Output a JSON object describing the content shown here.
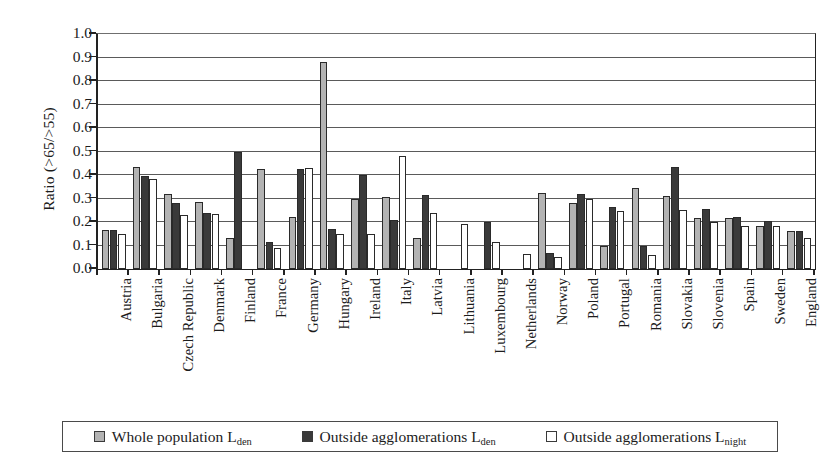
{
  "chart_data": {
    "type": "bar",
    "title": "",
    "xlabel": "",
    "ylabel": "Ratio (>65/>55)",
    "ylim": [
      0.0,
      1.0
    ],
    "ytick_labels": [
      "0.0",
      "0.1",
      "0.2",
      "0.3",
      "0.4",
      "0.5",
      "0.6",
      "0.7",
      "0.8",
      "0.9",
      "1.0"
    ],
    "ytick_values": [
      0.0,
      0.1,
      0.2,
      0.3,
      0.4,
      0.5,
      0.6,
      0.7,
      0.8,
      0.9,
      1.0
    ],
    "grid": true,
    "legend_position": "bottom",
    "categories": [
      "Austria",
      "Bulgaria",
      "Czech Republic",
      "Denmark",
      "Finland",
      "France",
      "Germany",
      "Hungary",
      "Ireland",
      "Italy",
      "Latvia",
      "Lithuania",
      "Luxembourg",
      "Netherlands",
      "Norway",
      "Poland",
      "Portugal",
      "Romania",
      "Slovakia",
      "Slovenia",
      "Spain",
      "Sweden",
      "England"
    ],
    "series": [
      {
        "name": "Whole population Lden",
        "name_base": "Whole population L",
        "name_sub": "den",
        "color": "#b3b3b3",
        "values": [
          0.165,
          0.435,
          0.32,
          0.285,
          0.13,
          0.425,
          0.22,
          0.88,
          0.3,
          0.305,
          0.13,
          null,
          null,
          null,
          0.325,
          0.28,
          0.1,
          0.345,
          0.31,
          0.215,
          0.215,
          0.185,
          0.16
        ]
      },
      {
        "name": "Outside agglomerations Lden",
        "name_base": "Outside agglomerations L",
        "name_sub": "den",
        "color": "#3a3a3a",
        "values": [
          0.165,
          0.395,
          0.28,
          0.24,
          0.5,
          0.115,
          0.425,
          0.17,
          0.4,
          0.21,
          0.315,
          null,
          0.2,
          null,
          0.07,
          0.32,
          0.265,
          0.1,
          0.435,
          0.255,
          0.22,
          0.205,
          0.16
        ]
      },
      {
        "name": "Outside agglomerations Lnight",
        "name_base": "Outside agglomerations L",
        "name_sub": "night",
        "color": "#ffffff",
        "values": [
          0.15,
          0.385,
          0.23,
          0.235,
          null,
          0.09,
          0.43,
          0.15,
          0.15,
          0.48,
          0.24,
          0.19,
          0.115,
          0.065,
          0.05,
          0.3,
          0.245,
          0.06,
          0.25,
          0.2,
          0.185,
          0.185,
          0.13
        ]
      }
    ]
  }
}
